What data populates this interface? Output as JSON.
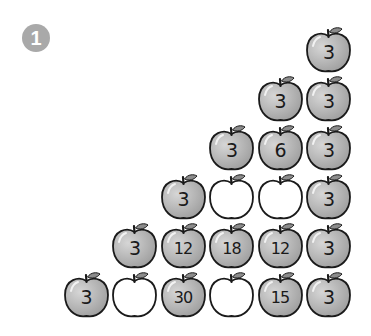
{
  "badge": {
    "label": "1"
  },
  "colors": {
    "filled_apple": "#a0a0a0",
    "filled_apple_light": "#d6d6d6",
    "empty_apple": "#ffffff",
    "outline": "#1a1a1a",
    "leaf": "#8c8c8c",
    "badge": "#a9a9a9"
  },
  "pyramid": {
    "rows": [
      {
        "cells": [
          {
            "value": "3",
            "filled": true
          }
        ]
      },
      {
        "cells": [
          {
            "value": "3",
            "filled": true
          },
          {
            "value": "3",
            "filled": true
          }
        ]
      },
      {
        "cells": [
          {
            "value": "3",
            "filled": true
          },
          {
            "value": "6",
            "filled": true
          },
          {
            "value": "3",
            "filled": true
          }
        ]
      },
      {
        "cells": [
          {
            "value": "3",
            "filled": true
          },
          {
            "value": "",
            "filled": false
          },
          {
            "value": "",
            "filled": false
          },
          {
            "value": "3",
            "filled": true
          }
        ]
      },
      {
        "cells": [
          {
            "value": "3",
            "filled": true
          },
          {
            "value": "12",
            "filled": true
          },
          {
            "value": "18",
            "filled": true
          },
          {
            "value": "12",
            "filled": true
          },
          {
            "value": "3",
            "filled": true
          }
        ]
      },
      {
        "cells": [
          {
            "value": "3",
            "filled": true
          },
          {
            "value": "",
            "filled": false
          },
          {
            "value": "30",
            "filled": true
          },
          {
            "value": "",
            "filled": false
          },
          {
            "value": "15",
            "filled": true
          },
          {
            "value": "3",
            "filled": true
          }
        ]
      }
    ]
  }
}
